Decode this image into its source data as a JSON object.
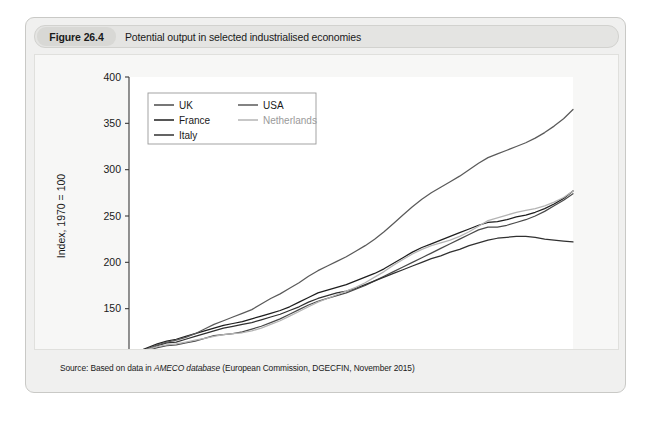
{
  "figure": {
    "number_label": "Figure 26.4",
    "caption": "Potential output in selected industrialised economies",
    "source_prefix": "Source: Based on data in ",
    "source_italic": "AMECO database",
    "source_suffix": " (European Commission, DGECFIN, November 2015)"
  },
  "colors": {
    "card_bg": "#f0f0ef",
    "title_bar_bg": "#e4e4e2",
    "panel_bg": "#f7f7f6",
    "plot_bg": "#ffffff",
    "axis": "#3a3a3a",
    "uk": "#4a4a4a",
    "france": "#1e1e1e",
    "italy": "#303030",
    "usa": "#5a5a5a",
    "netherlands": "#b4b4b4"
  },
  "chart_data": {
    "type": "line",
    "title": "Potential output in selected industrialised economies",
    "xlabel": "",
    "ylabel": "Index, 1970 = 100",
    "xlim": [
      1970,
      2017
    ],
    "ylim": [
      100,
      400
    ],
    "yticks": [
      100,
      150,
      200,
      250,
      300,
      350,
      400
    ],
    "xticks": [
      1970,
      1975,
      1980,
      1985,
      1990,
      1995,
      2000,
      2005,
      2010,
      2015
    ],
    "xtick_labels": [
      "1970",
      "1975",
      "1980",
      "1985",
      "1990",
      "1995",
      "2000",
      "2005",
      "2010",
      "2015"
    ],
    "ytick_labels": [
      "100",
      "150",
      "200",
      "250",
      "300",
      "350",
      "400"
    ],
    "minor_xtick_interval": 1,
    "grid": false,
    "legend_position": "upper-left-inside",
    "x": [
      1970,
      1971,
      1972,
      1973,
      1974,
      1975,
      1976,
      1977,
      1978,
      1979,
      1980,
      1981,
      1982,
      1983,
      1984,
      1985,
      1986,
      1987,
      1988,
      1989,
      1990,
      1991,
      1992,
      1993,
      1994,
      1995,
      1996,
      1997,
      1998,
      1999,
      2000,
      2001,
      2002,
      2003,
      2004,
      2005,
      2006,
      2007,
      2008,
      2009,
      2010,
      2011,
      2012,
      2013,
      2014,
      2015,
      2016,
      2017
    ],
    "series": [
      {
        "name": "UK",
        "color": "#4a4a4a",
        "values": [
          100,
          102,
          105,
          108,
          110,
          111,
          113,
          115,
          118,
          121,
          122,
          123,
          125,
          128,
          131,
          135,
          139,
          144,
          149,
          154,
          158,
          161,
          164,
          167,
          171,
          175,
          180,
          185,
          190,
          195,
          200,
          205,
          210,
          215,
          220,
          225,
          230,
          235,
          238,
          238,
          240,
          243,
          246,
          250,
          255,
          261,
          267,
          274
        ]
      },
      {
        "name": "France",
        "color": "#1e1e1e",
        "values": [
          100,
          104,
          108,
          112,
          115,
          117,
          120,
          123,
          126,
          129,
          132,
          134,
          136,
          139,
          142,
          145,
          148,
          152,
          157,
          162,
          167,
          170,
          173,
          176,
          180,
          184,
          188,
          193,
          199,
          205,
          211,
          216,
          220,
          224,
          228,
          232,
          236,
          240,
          243,
          244,
          246,
          249,
          251,
          254,
          258,
          263,
          269,
          277
        ]
      },
      {
        "name": "Italy",
        "color": "#303030",
        "values": [
          100,
          103,
          106,
          110,
          113,
          114,
          117,
          120,
          123,
          126,
          129,
          131,
          133,
          135,
          138,
          141,
          144,
          148,
          152,
          157,
          161,
          164,
          167,
          169,
          172,
          176,
          180,
          184,
          188,
          192,
          196,
          200,
          204,
          207,
          211,
          214,
          218,
          221,
          224,
          226,
          227,
          228,
          228,
          227,
          225,
          224,
          223,
          222
        ]
      },
      {
        "name": "USA",
        "color": "#5a5a5a",
        "values": [
          100,
          103,
          107,
          111,
          114,
          116,
          119,
          123,
          128,
          133,
          137,
          141,
          145,
          149,
          155,
          161,
          166,
          172,
          178,
          185,
          191,
          196,
          201,
          206,
          212,
          218,
          225,
          233,
          242,
          251,
          260,
          268,
          275,
          281,
          287,
          293,
          300,
          307,
          313,
          317,
          321,
          325,
          329,
          334,
          340,
          347,
          355,
          365
        ]
      },
      {
        "name": "Netherlands",
        "color": "#b4b4b4",
        "values": [
          100,
          103,
          106,
          109,
          111,
          112,
          114,
          116,
          118,
          120,
          122,
          123,
          124,
          126,
          129,
          133,
          137,
          142,
          147,
          152,
          157,
          161,
          165,
          169,
          173,
          178,
          184,
          190,
          197,
          203,
          209,
          214,
          218,
          221,
          224,
          228,
          233,
          239,
          245,
          248,
          251,
          254,
          256,
          258,
          261,
          265,
          270,
          277
        ]
      }
    ]
  },
  "legend": {
    "items": [
      {
        "label": "UK",
        "color": "#4a4a4a",
        "column": 0,
        "row": 0
      },
      {
        "label": "France",
        "color": "#1e1e1e",
        "column": 0,
        "row": 1
      },
      {
        "label": "Italy",
        "color": "#303030",
        "column": 0,
        "row": 2
      },
      {
        "label": "USA",
        "color": "#5a5a5a",
        "column": 1,
        "row": 0
      },
      {
        "label": "Netherlands",
        "color": "#b4b4b4",
        "column": 1,
        "row": 1
      }
    ]
  }
}
